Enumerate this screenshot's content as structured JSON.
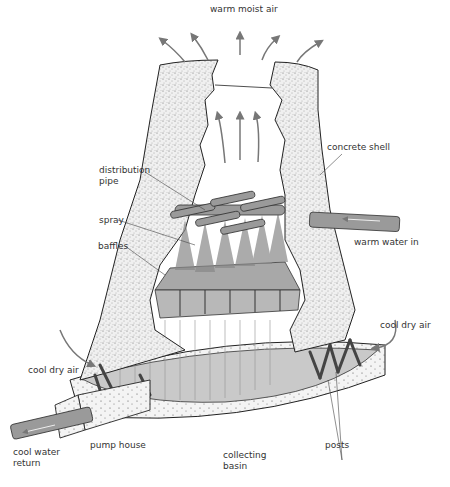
{
  "diagram": {
    "labels": {
      "warm_moist_air": "warm moist air",
      "distribution_pipe": "distribution\npipe",
      "concrete_shell": "concrete shell",
      "spray": "spray",
      "baffles": "baffles",
      "warm_water_in": "warm water in",
      "cool_dry_air_right": "cool dry air",
      "cool_dry_air_left": "cool dry air",
      "pump_house": "pump house",
      "cool_water_return": "cool water\nreturn",
      "collecting_basin": "collecting\nbasin",
      "posts": "posts"
    },
    "colors": {
      "concrete": "#e8e8e8",
      "stipple": "#555555",
      "pipe": "#9a9a9a",
      "outline": "#222222",
      "arrow": "#777777",
      "water": "#bfbfbf"
    }
  }
}
